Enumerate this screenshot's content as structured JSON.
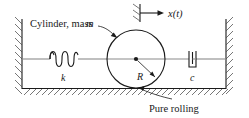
{
  "figure": {
    "background_color": "#ffffff",
    "line_color": "#1a1a1a",
    "axis_color": "#8a8a8a",
    "hatch_color": "#4a4a4a",
    "width": 249,
    "height": 118
  },
  "labels": {
    "cylinder_mass": "Cylinder, mass",
    "cylinder_mass_symbol": "m",
    "displacement": "x(t)",
    "spring_constant": "k",
    "damping_constant": "c",
    "radius": "R",
    "pure_rolling": "Pure rolling"
  },
  "elements": {
    "left_wall": "fixed-wall-left",
    "right_wall": "fixed-wall-right",
    "ground": "ground-surface",
    "spring": "spring-k",
    "damper": "damper-c",
    "cylinder": "rolling-cylinder",
    "center_dot": "cylinder-center",
    "radius_arrow": "radius-indicator",
    "datum": "fixed-datum-mark",
    "displacement_arrow": "displacement-arrow"
  },
  "geometry": {
    "cylinder_center_x": 136,
    "cylinder_center_y": 59,
    "cylinder_radius": 29,
    "ground_y": 88,
    "centerline_y": 59,
    "left_wall_x": 22,
    "right_wall_x": 226
  }
}
